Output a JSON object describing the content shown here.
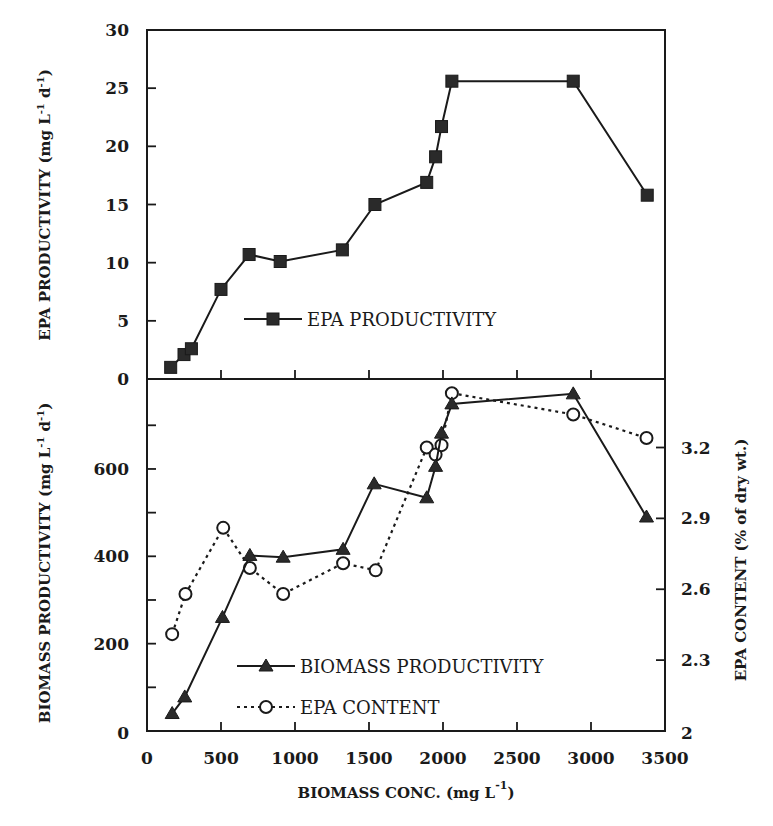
{
  "figure": {
    "colors": {
      "ink": "#1a1a1a",
      "background": "#ffffff",
      "marker_fill": "#2a2a2a"
    }
  },
  "chart_data": [
    {
      "panel": "top",
      "type": "line",
      "title": "",
      "xlabel": "",
      "ylabel": "EPA PRODUCTIVITY (mg L-1 d-1)",
      "ylabel_parts": {
        "main": "EPA PRODUCTIVITY (mg L",
        "sup1": "-1",
        "mid": " d",
        "sup2": "-1",
        "end": ")"
      },
      "xlim": [
        0,
        3500
      ],
      "ylim": [
        0,
        30
      ],
      "yticks": [
        0,
        5,
        10,
        15,
        20,
        25,
        30
      ],
      "ytick_labels": [
        "0",
        "5",
        "10",
        "15",
        "20",
        "25",
        "30"
      ],
      "xticks": [
        500,
        1000,
        1500,
        2000,
        2500,
        3000
      ],
      "grid": false,
      "legend_position": "lower-center",
      "series": [
        {
          "name": "EPA PRODUCTIVITY",
          "marker": "filled-square",
          "line": "solid",
          "x": [
            160,
            250,
            300,
            500,
            690,
            900,
            1320,
            1540,
            1890,
            1950,
            1990,
            2060,
            2880,
            3380
          ],
          "y": [
            1.0,
            2.1,
            2.6,
            7.7,
            10.7,
            10.1,
            11.1,
            15.0,
            16.9,
            19.1,
            21.7,
            25.6,
            25.6,
            15.8
          ]
        }
      ]
    },
    {
      "panel": "bottom",
      "type": "line",
      "title": "",
      "xlabel": "BIOMASS CONC. (mg L-1)",
      "xlabel_parts": {
        "main": "BIOMASS CONC. (mg L",
        "sup": "-1",
        "end": ")"
      },
      "ylabel": "BIOMASS PRODUCTIVITY (mg L-1 d-1)",
      "ylabel_parts": {
        "main": "BIOMASS PRODUCTIVITY (mg L",
        "sup1": "-1",
        "mid": " d",
        "sup2": "-1",
        "end": ")"
      },
      "ylabel_right": "EPA CONTENT (% of dry wt.)",
      "xlim": [
        0,
        3500
      ],
      "xticks": [
        0,
        500,
        1000,
        1500,
        2000,
        2500,
        3000,
        3500
      ],
      "xtick_labels": [
        "0",
        "500",
        "1000",
        "1500",
        "2000",
        "2500",
        "3000",
        "3500"
      ],
      "ylim": [
        0,
        806
      ],
      "yticks": [
        0,
        100,
        200,
        300,
        400,
        500,
        600,
        700
      ],
      "ytick_labels": {
        "0": "0",
        "200": "200",
        "400": "400",
        "600": "600"
      },
      "ylim_right": [
        2.0,
        3.49
      ],
      "yticks_right": [
        2.0,
        2.3,
        2.6,
        2.9,
        3.2
      ],
      "ytick_labels_right": [
        "2",
        "2.3",
        "2.6",
        "2.9",
        "3.2"
      ],
      "grid": false,
      "legend_position": "lower-center",
      "series": [
        {
          "name": "BIOMASS PRODUCTIVITY",
          "axis": "left",
          "marker": "filled-triangle",
          "line": "solid",
          "x": [
            170,
            255,
            510,
            695,
            920,
            1325,
            1535,
            1890,
            1950,
            1990,
            2060,
            2880,
            3375
          ],
          "y": [
            40,
            78,
            260,
            402,
            398,
            416,
            566,
            534,
            606,
            682,
            749,
            772,
            490
          ]
        },
        {
          "name": "EPA CONTENT",
          "axis": "right",
          "marker": "open-circle",
          "line": "dotted",
          "x": [
            170,
            260,
            515,
            695,
            920,
            1325,
            1545,
            1890,
            1950,
            1990,
            2060,
            2880,
            3375
          ],
          "y": [
            2.41,
            2.58,
            2.86,
            2.69,
            2.58,
            2.71,
            2.68,
            3.2,
            3.17,
            3.21,
            3.43,
            3.34,
            3.24
          ]
        }
      ]
    }
  ]
}
